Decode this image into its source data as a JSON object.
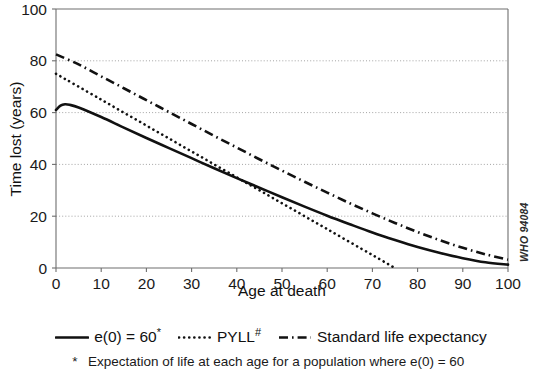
{
  "chart_data": {
    "type": "line",
    "title": "",
    "xlabel": "Age at death",
    "ylabel": "Time lost (years)",
    "xlim": [
      0,
      100
    ],
    "ylim": [
      0,
      100
    ],
    "xticks": [
      0,
      10,
      20,
      30,
      40,
      50,
      60,
      70,
      80,
      90,
      100
    ],
    "yticks": [
      0,
      20,
      40,
      60,
      80,
      100
    ],
    "grid": "horizontal-dotted",
    "legend_position": "below-plot",
    "series": [
      {
        "name": "e(0) = 60*",
        "legend_label": "e(0) = 60",
        "legend_sup": "*",
        "style": "solid",
        "x": [
          0,
          1,
          2,
          3,
          5,
          10,
          15,
          20,
          25,
          30,
          35,
          40,
          45,
          50,
          55,
          60,
          65,
          70,
          75,
          80,
          85,
          90,
          95,
          100
        ],
        "y": [
          61.0,
          62.7,
          63.2,
          63.0,
          62.0,
          58.3,
          54.2,
          50.2,
          46.3,
          42.4,
          38.5,
          34.7,
          31.0,
          27.3,
          23.7,
          20.2,
          16.9,
          13.7,
          10.8,
          8.1,
          5.8,
          3.8,
          2.2,
          1.3
        ]
      },
      {
        "name": "PYLL#",
        "legend_label": "PYLL",
        "legend_sup": "#",
        "style": "dotted",
        "x": [
          0,
          10,
          20,
          30,
          40,
          50,
          60,
          70,
          75
        ],
        "y": [
          75.0,
          65.0,
          55.0,
          45.0,
          35.0,
          25.0,
          15.0,
          5.0,
          0.0
        ]
      },
      {
        "name": "Standard life expectancy",
        "legend_label": "Standard life expectancy",
        "legend_sup": "",
        "style": "dashdot",
        "x": [
          0,
          5,
          10,
          15,
          20,
          25,
          30,
          35,
          40,
          45,
          50,
          55,
          60,
          65,
          70,
          75,
          80,
          85,
          90,
          95,
          100
        ],
        "y": [
          82.5,
          78.6,
          74.0,
          69.4,
          64.8,
          60.2,
          55.6,
          51.0,
          46.5,
          42.0,
          37.6,
          33.3,
          29.1,
          25.0,
          21.1,
          17.4,
          13.9,
          10.7,
          7.8,
          5.3,
          3.2
        ]
      }
    ]
  },
  "axes": {
    "x_title": "Age at death",
    "y_title": "Time lost (years)"
  },
  "annotations": {
    "who_code": "WHO 94084"
  },
  "legend": {
    "items": [
      {
        "label": "e(0) = 60",
        "sup": "*",
        "style": "solid"
      },
      {
        "label": "PYLL",
        "sup": "#",
        "style": "dotted"
      },
      {
        "label": "Standard life expectancy",
        "sup": "",
        "style": "dashdot"
      }
    ]
  },
  "footnotes": [
    {
      "symbol": "*",
      "text": "Expectation of life at each age for a population where e(0) = 60"
    }
  ]
}
